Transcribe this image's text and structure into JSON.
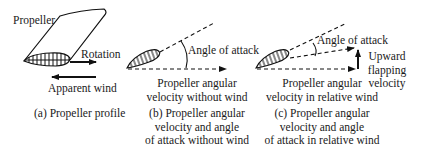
{
  "panel_a": {
    "label_propeller": "Propeller",
    "label_rotation": "Rotation",
    "label_apparent_wind": "Apparent wind",
    "caption": "(a) Propeller profile"
  },
  "panel_b": {
    "label_angle": "Angle of attack",
    "label_velocity_line1": "Propeller angular",
    "label_velocity_line2": "velocity without wind",
    "caption_line1": "(b) Propeller angular",
    "caption_line2": "velocity and angle",
    "caption_line3": "of attack without wind"
  },
  "panel_c": {
    "label_angle": "Angle of attack",
    "label_upward_line1": "Upward",
    "label_upward_line2": "flapping",
    "label_upward_line3": "velocity",
    "label_velocity_line1": "Propeller angular",
    "label_velocity_line2": "velocity in relative wind",
    "caption_line1": "(c) Propeller angular",
    "caption_line2": "velocity and angle",
    "caption_line3": "of attack in relative wind"
  }
}
